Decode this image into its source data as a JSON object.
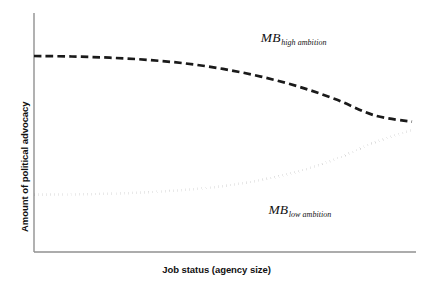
{
  "chart_data": {
    "type": "line",
    "title": "",
    "subtitle": "",
    "xlabel": "Job status (agency size)",
    "ylabel": "Amount of political advocacy",
    "xlim": [
      0,
      100
    ],
    "ylim": [
      0,
      100
    ],
    "grid": false,
    "legend_position": "inline-annotations",
    "axis_ticks": {
      "x": [],
      "y": []
    },
    "series": [
      {
        "name": "MB_high ambition",
        "label_base": "MB",
        "label_sub": "high ambition",
        "style": "dashed",
        "color": "#1a1a1a",
        "x": [
          0,
          10,
          20,
          30,
          40,
          50,
          60,
          70,
          80,
          90,
          100
        ],
        "values": [
          82,
          81.8,
          81.3,
          80.4,
          78.9,
          76.6,
          73.4,
          69.2,
          63.8,
          57.2,
          54.5
        ],
        "annotation_x": 60,
        "annotation_y": 90
      },
      {
        "name": "MB_low ambition",
        "label_base": "MB",
        "label_sub": "low ambition",
        "style": "dotted",
        "color": "#1a1a1a",
        "x": [
          0,
          10,
          20,
          30,
          40,
          50,
          60,
          70,
          80,
          90,
          100
        ],
        "values": [
          24,
          24.1,
          24.4,
          25.0,
          26.0,
          27.6,
          30.1,
          33.8,
          39.0,
          45.8,
          51.0
        ],
        "annotation_x": 62,
        "annotation_y": 18
      }
    ],
    "axis_color": "#8c8c8c",
    "background": "#ffffff"
  },
  "figure": {
    "y_axis_label": "Amount of political advocacy",
    "x_axis_label": "Job status (agency size)",
    "high_label_base": "MB",
    "high_label_sub": "high ambition",
    "low_label_base": "MB",
    "low_label_sub": "low ambition"
  }
}
